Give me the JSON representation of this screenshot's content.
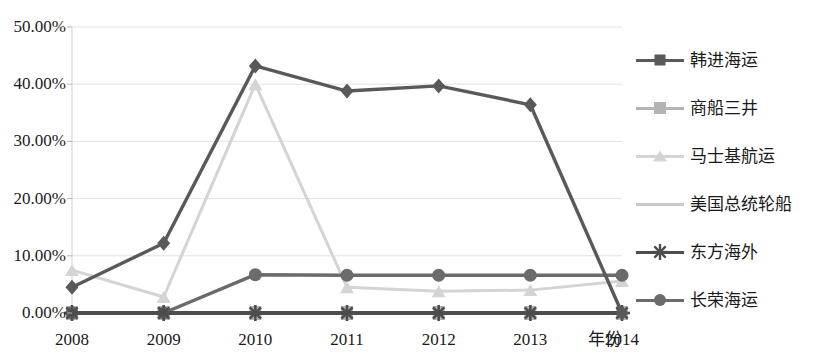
{
  "chart_data": {
    "type": "line",
    "title": "",
    "xlabel": "年份",
    "ylabel": "",
    "categories": [
      "2008",
      "2009",
      "2010",
      "2011",
      "2012",
      "2013",
      "2014"
    ],
    "x_tick_labels": [
      "2008",
      "2009",
      "2010",
      "2011",
      "2012",
      "2013",
      "2014"
    ],
    "y_tick_labels": [
      "0.00%",
      "10.00%",
      "20.00%",
      "30.00%",
      "40.00%",
      "50.00%"
    ],
    "y_tick_values": [
      0,
      10,
      20,
      30,
      40,
      50
    ],
    "ylim": [
      0,
      50
    ],
    "grid": true,
    "legend_position": "right",
    "units": "percent",
    "series": [
      {
        "name": "韩进海运",
        "marker": "diamond",
        "color": "#595959",
        "values": [
          4.5,
          12.2,
          43.2,
          38.8,
          39.7,
          36.4,
          0.0
        ]
      },
      {
        "name": "商船三井",
        "marker": "square",
        "color": "#b3b3b3",
        "values": [
          0.0,
          0.0,
          0.0,
          0.0,
          0.0,
          0.0,
          0.0
        ]
      },
      {
        "name": "马士基航运",
        "marker": "triangle",
        "color": "#d4d4d4",
        "values": [
          7.5,
          2.8,
          40.0,
          4.5,
          3.8,
          4.0,
          5.6
        ]
      },
      {
        "name": "美国总统轮船",
        "marker": "none",
        "color": "#c9c9c9",
        "values": [
          0.0,
          0.0,
          0.0,
          0.0,
          0.0,
          0.0,
          0.0
        ]
      },
      {
        "name": "东方海外",
        "marker": "asterisk",
        "color": "#4d4d4d",
        "values": [
          0.0,
          0.0,
          0.0,
          0.0,
          0.0,
          0.0,
          0.0
        ]
      },
      {
        "name": "长荣海运",
        "marker": "circle",
        "color": "#6b6b6b",
        "values": [
          0.0,
          0.0,
          6.7,
          6.6,
          6.6,
          6.6,
          6.6
        ]
      }
    ]
  },
  "legend": {
    "items": [
      {
        "label": "韩进海运"
      },
      {
        "label": "商船三井"
      },
      {
        "label": "马士基航运"
      },
      {
        "label": "美国总统轮船"
      },
      {
        "label": "东方海外"
      },
      {
        "label": "长荣海运"
      }
    ]
  },
  "axes": {
    "x_title": "年份"
  }
}
